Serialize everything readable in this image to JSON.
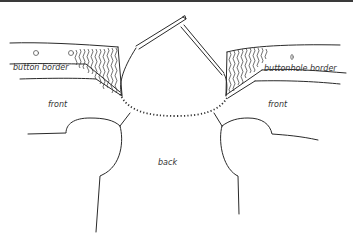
{
  "diagram": {
    "labels": {
      "button_border": "button border",
      "buttonhole_border": "buttonhole border",
      "front_left": "front",
      "front_right": "front",
      "back": "back"
    },
    "parts": [
      "button border",
      "buttonhole border",
      "front (left)",
      "front (right)",
      "back",
      "knitting needles",
      "picked-up neckline stitches"
    ],
    "colors": {
      "ink": "#2a2a2a",
      "background": "#ffffff",
      "top_bar": "#3a3a3a"
    }
  }
}
